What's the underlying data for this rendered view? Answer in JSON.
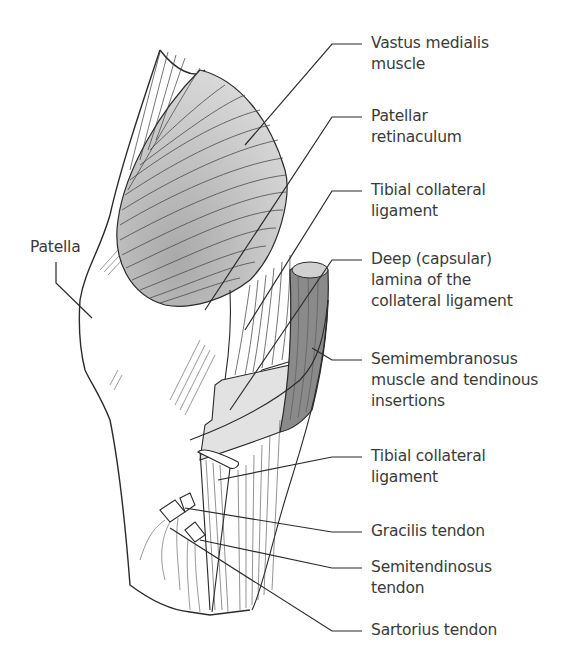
{
  "figure": {
    "colors": {
      "line": "#2b2b2b",
      "muscle_shade": "#bdbdbd",
      "semimembranosus": "#8a8a8a",
      "capsule_shade": "#e2e2e2",
      "label_text": "#3a3a3a"
    }
  },
  "labels": {
    "patella": "Patella",
    "vastus_medialis": [
      "Vastus medialis",
      "muscle"
    ],
    "patellar_retinaculum": [
      "Patellar",
      "retinaculum"
    ],
    "tibial_collateral_upper": [
      "Tibial collateral",
      "ligament"
    ],
    "deep_lamina": [
      "Deep (capsular)",
      "lamina of the",
      "collateral ligament"
    ],
    "semimembranosus": [
      "Semimembranosus",
      "muscle and tendinous",
      "insertions"
    ],
    "tibial_collateral_lower": [
      "Tibial collateral",
      "ligament"
    ],
    "gracilis": "Gracilis tendon",
    "semitendinosus": [
      "Semitendinosus",
      "tendon"
    ],
    "sartorius": "Sartorius tendon"
  }
}
